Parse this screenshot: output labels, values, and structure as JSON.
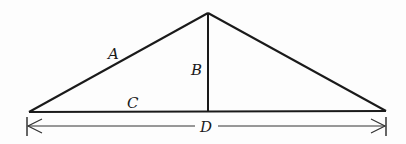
{
  "diagram": {
    "type": "triangle-with-altitude",
    "colors": {
      "stroke": "#1a1a1a",
      "dimension": "#333333",
      "background": "#fdfdfd"
    },
    "points": {
      "left": [
        29,
        112
      ],
      "apex": [
        208,
        13
      ],
      "right": [
        386,
        111
      ],
      "foot": [
        208,
        112
      ]
    },
    "labels": {
      "A": "A",
      "B": "B",
      "C": "C",
      "D": "D"
    },
    "label_descriptions": {
      "A": "left slanted side (hypotenuse of left right triangle)",
      "B": "vertical altitude from apex to base",
      "C": "left portion of base",
      "D": "total base span dimension"
    }
  }
}
